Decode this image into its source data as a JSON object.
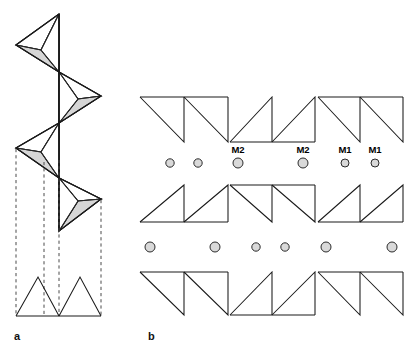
{
  "figure": {
    "background_color": "#ffffff",
    "stroke_color": "#1a1a1a",
    "shade_color": "#d6d6d6",
    "cation_fill": "#d9d9d9",
    "cation_stroke": "#2b2b2b",
    "width": 414,
    "height": 351
  },
  "panels": [
    {
      "id": "a",
      "label": "a",
      "label_x": 14,
      "label_y": 340,
      "description": "Perspective view of a zig-zag single chain of corner-sharing tetrahedra with dashed projection lines down to a two-triangle plan view"
    },
    {
      "id": "b",
      "label": "b",
      "label_x": 148,
      "label_y": 340,
      "description": "Plan view of three rows of paired triangles separated by rows of cation circles labelled M1 and M2"
    }
  ],
  "panel_a": {
    "spine_x": 59,
    "spine_top": 14,
    "spine_bottom": 231,
    "tetrahedra": [
      {
        "index": 0,
        "direction": "left",
        "apex_x": 16,
        "apex_y": 45,
        "top_y": 14,
        "bottom_y": 72,
        "shade": "shade"
      },
      {
        "index": 1,
        "direction": "right",
        "apex_x": 101,
        "apex_y": 96,
        "top_y": 72,
        "bottom_y": 123,
        "shade": "shade"
      },
      {
        "index": 2,
        "direction": "left",
        "apex_x": 16,
        "apex_y": 148,
        "top_y": 123,
        "bottom_y": 178,
        "shade": "shade"
      },
      {
        "index": 3,
        "direction": "right",
        "apex_x": 101,
        "apex_y": 199,
        "top_y": 178,
        "bottom_y": 231,
        "shade": "shade"
      }
    ],
    "dashed_lines": [
      {
        "x": 16,
        "y_top": 149,
        "y_bottom": 316
      },
      {
        "x": 44,
        "y_top": 162,
        "y_bottom": 316
      },
      {
        "x": 59,
        "y_top": 160,
        "y_bottom": 316
      },
      {
        "x": 101,
        "y_top": 200,
        "y_bottom": 316
      }
    ],
    "projection": {
      "baseline_y": 316,
      "apex_y": 277,
      "left_x": 16,
      "right_x": 101,
      "mid_x": 59,
      "triangles": [
        {
          "orientation": "up",
          "x1": 16,
          "x2": 59,
          "apex_x": 38
        },
        {
          "orientation": "up",
          "x1": 59,
          "x2": 101,
          "apex_x": 80
        }
      ]
    }
  },
  "panel_b": {
    "origin_x": 140,
    "rows": [
      {
        "index": 0,
        "baseline_y": 97,
        "apex_y": 142,
        "groups": [
          {
            "orientation": "down",
            "x_start": 140,
            "x_mid": 184,
            "x_end": 228
          },
          {
            "orientation": "up",
            "x_start": 230,
            "x_mid": 272,
            "x_end": 315
          },
          {
            "orientation": "down",
            "x_start": 318,
            "x_mid": 360,
            "x_end": 403
          }
        ]
      },
      {
        "index": 1,
        "baseline_y": 222,
        "apex_y": 185,
        "groups": [
          {
            "orientation": "up",
            "x_start": 140,
            "x_mid": 184,
            "x_end": 228
          },
          {
            "orientation": "down",
            "x_start": 230,
            "x_mid": 272,
            "x_end": 315
          },
          {
            "orientation": "up",
            "x_start": 318,
            "x_mid": 360,
            "x_end": 403
          }
        ]
      },
      {
        "index": 2,
        "baseline_y": 272,
        "apex_y": 315,
        "groups": [
          {
            "orientation": "down",
            "x_start": 140,
            "x_mid": 184,
            "x_end": 228
          },
          {
            "orientation": "up",
            "x_start": 230,
            "x_mid": 272,
            "x_end": 315
          },
          {
            "orientation": "down",
            "x_start": 318,
            "x_mid": 360,
            "x_end": 403
          }
        ]
      }
    ],
    "cation_rows": [
      {
        "index": 0,
        "y": 163,
        "label_y": 153,
        "sites": [
          {
            "x": 170,
            "r": 4.2,
            "label": "",
            "site": "unlabelled"
          },
          {
            "x": 198,
            "r": 4.2,
            "label": "",
            "site": "unlabelled"
          },
          {
            "x": 238,
            "r": 5.0,
            "label": "M2",
            "site": "M2"
          },
          {
            "x": 303,
            "r": 5.0,
            "label": "M2",
            "site": "M2"
          },
          {
            "x": 345,
            "r": 4.0,
            "label": "M1",
            "site": "M1"
          },
          {
            "x": 375,
            "r": 4.0,
            "label": "M1",
            "site": "M1"
          }
        ]
      },
      {
        "index": 1,
        "y": 247,
        "label_y": 0,
        "sites": [
          {
            "x": 150,
            "r": 5.0,
            "label": "",
            "site": "unlabelled"
          },
          {
            "x": 215,
            "r": 5.0,
            "label": "",
            "site": "unlabelled"
          },
          {
            "x": 256,
            "r": 4.2,
            "label": "",
            "site": "unlabelled"
          },
          {
            "x": 285,
            "r": 4.2,
            "label": "",
            "site": "unlabelled"
          },
          {
            "x": 326,
            "r": 5.0,
            "label": "",
            "site": "unlabelled"
          },
          {
            "x": 392,
            "r": 5.0,
            "label": "",
            "site": "unlabelled"
          }
        ]
      }
    ]
  }
}
